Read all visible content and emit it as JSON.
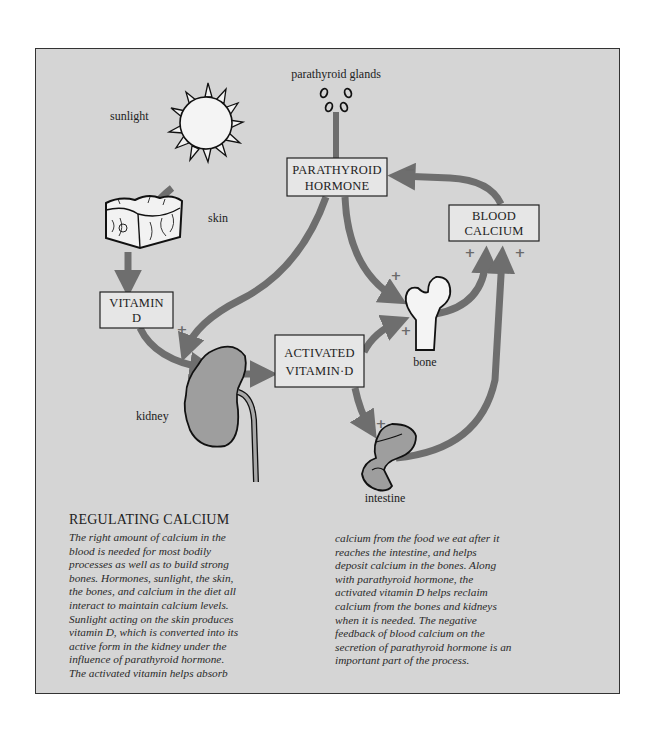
{
  "diagram": {
    "labels": {
      "parathyroid_glands": "parathyroid glands",
      "sunlight": "sunlight",
      "skin": "skin",
      "kidney": "kidney",
      "bone": "bone",
      "intestine": "intestine"
    },
    "boxes": {
      "parathyroid_hormone": [
        "PARATHYROID",
        "HORMONE"
      ],
      "blood_calcium": [
        "BLOOD",
        "CALCIUM"
      ],
      "vitamin_d": [
        "VITAMIN",
        "D"
      ],
      "activated_vitamin_d": [
        "ACTIVATED",
        "VITAMIN·D"
      ]
    },
    "signs": {
      "plus": "+",
      "minus": "−"
    },
    "colors": {
      "background": "#d5d5d5",
      "arrow": "#6e6e6e",
      "organ_fill": "#9e9e9e",
      "bone_fill": "#f4f4f4",
      "outline": "#111111"
    }
  },
  "caption": {
    "title": "REGULATING CALCIUM",
    "column1": [
      "The right amount of calcium in the",
      "blood is needed for most bodily",
      "processes as well as to build strong",
      "bones. Hormones, sunlight, the skin,",
      "the bones, and calcium in the diet all",
      "interact to maintain calcium levels.",
      "Sunlight acting on the skin produces",
      "vitamin D, which is converted into its",
      "active form in the kidney under the",
      "influence of parathyroid hormone.",
      "The activated vitamin helps absorb"
    ],
    "column2": [
      "calcium from the food we eat after it",
      "reaches the intestine, and helps",
      "deposit calcium in the bones. Along",
      "with parathyroid hormone, the",
      "activated vitamin D helps reclaim",
      "calcium from the bones and kidneys",
      "when it is needed. The negative",
      "feedback of blood calcium on the",
      "secretion of parathyroid hormone is an",
      "important part of the process."
    ]
  }
}
